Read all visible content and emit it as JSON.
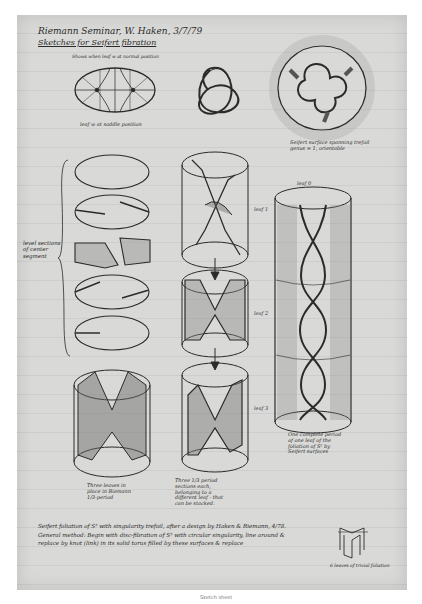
{
  "page": {
    "title_line1": "Riemann Seminar, W. Haken, 3/7/79",
    "title_line2": "Sketches for Seifert fibration",
    "subtitle": "Shows when leaf w at normal position"
  },
  "figures": {
    "ellipse_caption": "leaf w at saddle position",
    "seifert_caption": "Seifert surface spanning trefoil genus = 1, orientable",
    "level_sections_label": "level sections of center segment",
    "three_leaves_caption": "Three leaves in place in Riemann 1/3-period",
    "stacked_caption": "Three 1/3 period sections each, belonging to a different leaf - that can be stacked.",
    "complete_period_caption": "One complete period of one leaf of the foliation of S³ by Seifert surfaces",
    "leaf_top": "leaf 0",
    "side_leaves": [
      "leaf 1",
      "leaf 2",
      "leaf 3"
    ],
    "trivial_caption": "6 leaves of trivial foliation"
  },
  "notes": {
    "bottom_text": "Seifert foliation of S³ with singularity trefoil, after a design by Haken & Riemann, 4/78. General method: Begin with disc-fibration of S³ with circular singularity, line around & replace by knot (link) in its solid torus filled by these surfaces & replace"
  },
  "footer": {
    "caption": "Sketch sheet"
  },
  "colors": {
    "paper": "#d9d9d7",
    "ink": "#2a2a2a",
    "background": "#ffffff"
  }
}
